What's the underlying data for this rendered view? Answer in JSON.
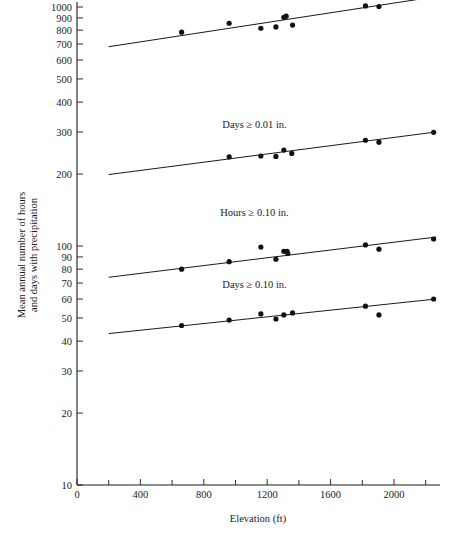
{
  "chart_data": {
    "type": "scatter",
    "title": "",
    "xlabel": "Elevation (ft)",
    "ylabel": "Mean annual number of hours and days with precipitation",
    "yscale": "log",
    "xscale": "linear",
    "xlim": [
      0,
      2265
    ],
    "ylim": [
      10,
      1160
    ],
    "grid": false,
    "legend": "inline-labels",
    "xticks": [
      0,
      400,
      800,
      1200,
      1600,
      2000
    ],
    "xtick_labels": [
      "0",
      "400",
      "800",
      "1200",
      "1600",
      "2000"
    ],
    "xminor_ticks": [
      200,
      600,
      1000,
      1400,
      1800,
      2200
    ],
    "yticks": [
      10,
      20,
      30,
      40,
      50,
      60,
      70,
      80,
      90,
      100,
      200,
      300,
      400,
      500,
      600,
      700,
      800,
      900,
      1000
    ],
    "ytick_labels": [
      "10",
      "20",
      "30",
      "40",
      "50",
      "60",
      "70",
      "80",
      "90",
      "100",
      "200",
      "300",
      "400",
      "500",
      "600",
      "700",
      "800",
      "900",
      "1000"
    ],
    "series": [
      {
        "name": "Hours ≥ 0.01 in.",
        "label": "Hours ≥ 0.01 in.",
        "label_x": 1120,
        "label_y": 1120,
        "points": [
          {
            "x": 660,
            "y": 785
          },
          {
            "x": 960,
            "y": 855
          },
          {
            "x": 1160,
            "y": 815
          },
          {
            "x": 1255,
            "y": 825
          },
          {
            "x": 1305,
            "y": 905
          },
          {
            "x": 1320,
            "y": 915
          },
          {
            "x": 1360,
            "y": 840
          },
          {
            "x": 1820,
            "y": 1010
          },
          {
            "x": 1905,
            "y": 1005
          },
          {
            "x": 2250,
            "y": 1110
          }
        ],
        "fit": {
          "x1": 200,
          "y1": 682,
          "x2": 2265,
          "y2": 1105
        }
      },
      {
        "name": "Days ≥ 0.01 in.",
        "label": "Days ≥ 0.01 in.",
        "label_x": 1120,
        "label_y": 313,
        "points": [
          {
            "x": 960,
            "y": 236
          },
          {
            "x": 1160,
            "y": 238
          },
          {
            "x": 1255,
            "y": 237
          },
          {
            "x": 1305,
            "y": 252
          },
          {
            "x": 1355,
            "y": 244
          },
          {
            "x": 1820,
            "y": 277
          },
          {
            "x": 1905,
            "y": 272
          },
          {
            "x": 2250,
            "y": 299
          }
        ],
        "fit": {
          "x1": 200,
          "y1": 199,
          "x2": 2265,
          "y2": 300
        }
      },
      {
        "name": "Hours ≥ 0.10 in.",
        "label": "Hours ≥ 0.10 in.",
        "label_x": 1120,
        "label_y": 133,
        "points": [
          {
            "x": 660,
            "y": 80
          },
          {
            "x": 960,
            "y": 86
          },
          {
            "x": 1160,
            "y": 99
          },
          {
            "x": 1255,
            "y": 88
          },
          {
            "x": 1305,
            "y": 95
          },
          {
            "x": 1325,
            "y": 95
          },
          {
            "x": 1330,
            "y": 93
          },
          {
            "x": 1820,
            "y": 101
          },
          {
            "x": 1905,
            "y": 97
          },
          {
            "x": 2250,
            "y": 107
          }
        ],
        "fit": {
          "x1": 200,
          "y1": 74,
          "x2": 2265,
          "y2": 109
        }
      },
      {
        "name": "Days ≥ 0.10 in.",
        "label": "Days ≥ 0.10 in.",
        "label_x": 1120,
        "label_y": 66.5,
        "points": [
          {
            "x": 660,
            "y": 46.5
          },
          {
            "x": 960,
            "y": 49
          },
          {
            "x": 1160,
            "y": 52
          },
          {
            "x": 1255,
            "y": 49.5
          },
          {
            "x": 1305,
            "y": 51.5
          },
          {
            "x": 1360,
            "y": 52.5
          },
          {
            "x": 1820,
            "y": 56
          },
          {
            "x": 1905,
            "y": 51.5
          },
          {
            "x": 2250,
            "y": 60
          }
        ],
        "fit": {
          "x1": 200,
          "y1": 43,
          "x2": 2265,
          "y2": 60
        }
      }
    ]
  }
}
